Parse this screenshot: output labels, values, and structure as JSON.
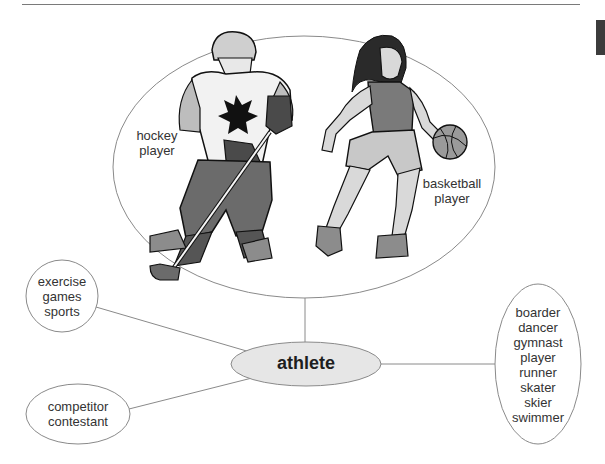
{
  "diagram": {
    "title_node": {
      "label": "athlete",
      "fill": "#e6e6e6"
    },
    "picture_node": {
      "labels": {
        "hockey": [
          "hockey",
          "player"
        ],
        "basketball": [
          "basketball",
          "player"
        ]
      },
      "illustrations": [
        "hockey-player-illustration",
        "basketball-player-illustration"
      ]
    },
    "nodes": {
      "activities": {
        "items": [
          "exercise",
          "games",
          "sports"
        ]
      },
      "people": {
        "items": [
          "competitor",
          "contestant"
        ]
      },
      "types": {
        "items": [
          "boarder",
          "dancer",
          "gymnast",
          "player",
          "runner",
          "skater",
          "skier",
          "swimmer"
        ]
      }
    },
    "colors": {
      "stroke": "#8a8a8a",
      "text": "#333333",
      "center_fill": "#e6e6e6",
      "tab": "#3c3c3c"
    }
  }
}
